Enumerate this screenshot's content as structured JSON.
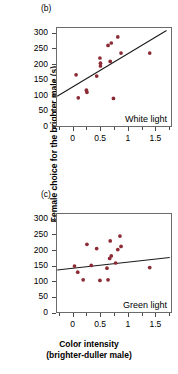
{
  "figure": {
    "ylabel": "Female choice for the brighter male (s)",
    "xlabel_line1": "Color intensity",
    "xlabel_line2": "(brighter-duller male)",
    "point_color": "#8c2b35",
    "line_color": "#1a1a1a",
    "frame_color": "#6b6b6b"
  },
  "panels": [
    {
      "tag": "(b)",
      "annotation": "White light"
    },
    {
      "tag": "(c)",
      "annotation": "Green light"
    }
  ],
  "chart_data": [
    {
      "type": "scatter",
      "title": "(b)",
      "annotation": "White light",
      "xlabel": "Color intensity (brighter-duller male)",
      "ylabel": "Female choice for the brighter male (s)",
      "xlim": [
        -0.3,
        1.8
      ],
      "ylim": [
        0,
        320
      ],
      "xticks": [
        0,
        0.5,
        1,
        1.5
      ],
      "yticks": [
        0,
        50,
        100,
        150,
        200,
        250,
        300
      ],
      "grid": false,
      "legend": "none",
      "points": [
        {
          "x": 0.05,
          "y": 167
        },
        {
          "x": 0.09,
          "y": 92
        },
        {
          "x": 0.24,
          "y": 117
        },
        {
          "x": 0.25,
          "y": 110
        },
        {
          "x": 0.43,
          "y": 163
        },
        {
          "x": 0.49,
          "y": 222
        },
        {
          "x": 0.5,
          "y": 205
        },
        {
          "x": 0.5,
          "y": 196
        },
        {
          "x": 0.64,
          "y": 263
        },
        {
          "x": 0.68,
          "y": 211
        },
        {
          "x": 0.7,
          "y": 271
        },
        {
          "x": 0.74,
          "y": 90
        },
        {
          "x": 0.82,
          "y": 291
        },
        {
          "x": 0.88,
          "y": 238
        },
        {
          "x": 1.41,
          "y": 238
        }
      ],
      "trendline": {
        "x0": -0.3,
        "y0": 97,
        "x1": 1.72,
        "y1": 312
      }
    },
    {
      "type": "scatter",
      "title": "(c)",
      "annotation": "Green light",
      "xlabel": "Color intensity (brighter-duller male)",
      "ylabel": "Female choice for the brighter male (s)",
      "xlim": [
        -0.3,
        1.8
      ],
      "ylim": [
        0,
        320
      ],
      "xticks": [
        0,
        0.5,
        1,
        1.5
      ],
      "yticks": [
        0,
        50,
        100,
        150,
        200,
        250,
        300
      ],
      "grid": false,
      "legend": "none",
      "points": [
        {
          "x": 0.02,
          "y": 150
        },
        {
          "x": 0.08,
          "y": 130
        },
        {
          "x": 0.18,
          "y": 105
        },
        {
          "x": 0.25,
          "y": 221
        },
        {
          "x": 0.33,
          "y": 152
        },
        {
          "x": 0.43,
          "y": 207
        },
        {
          "x": 0.49,
          "y": 103
        },
        {
          "x": 0.62,
          "y": 143
        },
        {
          "x": 0.64,
          "y": 105
        },
        {
          "x": 0.67,
          "y": 175
        },
        {
          "x": 0.68,
          "y": 232
        },
        {
          "x": 0.7,
          "y": 183
        },
        {
          "x": 0.78,
          "y": 160
        },
        {
          "x": 0.82,
          "y": 204
        },
        {
          "x": 0.86,
          "y": 248
        },
        {
          "x": 0.88,
          "y": 214
        },
        {
          "x": 1.41,
          "y": 145
        }
      ],
      "trendline": {
        "x0": -0.3,
        "y0": 137,
        "x1": 1.78,
        "y1": 178
      }
    }
  ]
}
